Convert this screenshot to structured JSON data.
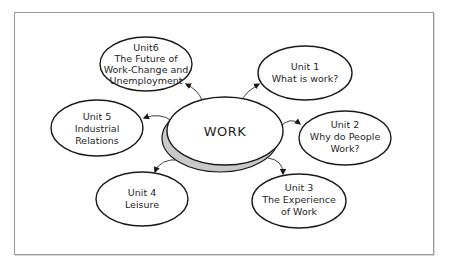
{
  "diagram": {
    "type": "concept-map",
    "center": {
      "label": "WORK"
    },
    "nodes": [
      {
        "id": "unit1",
        "lines": [
          "Unit 1",
          "What is work?"
        ]
      },
      {
        "id": "unit2",
        "lines": [
          "Unit 2",
          "Why do People",
          "Work?"
        ]
      },
      {
        "id": "unit3",
        "lines": [
          "Unit 3",
          "The Experience",
          "of Work"
        ]
      },
      {
        "id": "unit4",
        "lines": [
          "Unit 4",
          "Leisure"
        ]
      },
      {
        "id": "unit5",
        "lines": [
          "Unit 5",
          "Industrial",
          "Relations"
        ]
      },
      {
        "id": "unit6",
        "lines": [
          "Unit6",
          "The Future of",
          "Work-Change and",
          "Unemployment"
        ]
      }
    ],
    "edges": [
      {
        "from": "WORK",
        "to": "unit1"
      },
      {
        "from": "WORK",
        "to": "unit2"
      },
      {
        "from": "WORK",
        "to": "unit3"
      },
      {
        "from": "WORK",
        "to": "unit4"
      },
      {
        "from": "WORK",
        "to": "unit5"
      },
      {
        "from": "WORK",
        "to": "unit6"
      }
    ],
    "colors": {
      "stroke": "#1a1a1a",
      "center_shadow": "#c9c9c9",
      "frame": "#9a9a9a",
      "background": "#ffffff"
    }
  }
}
